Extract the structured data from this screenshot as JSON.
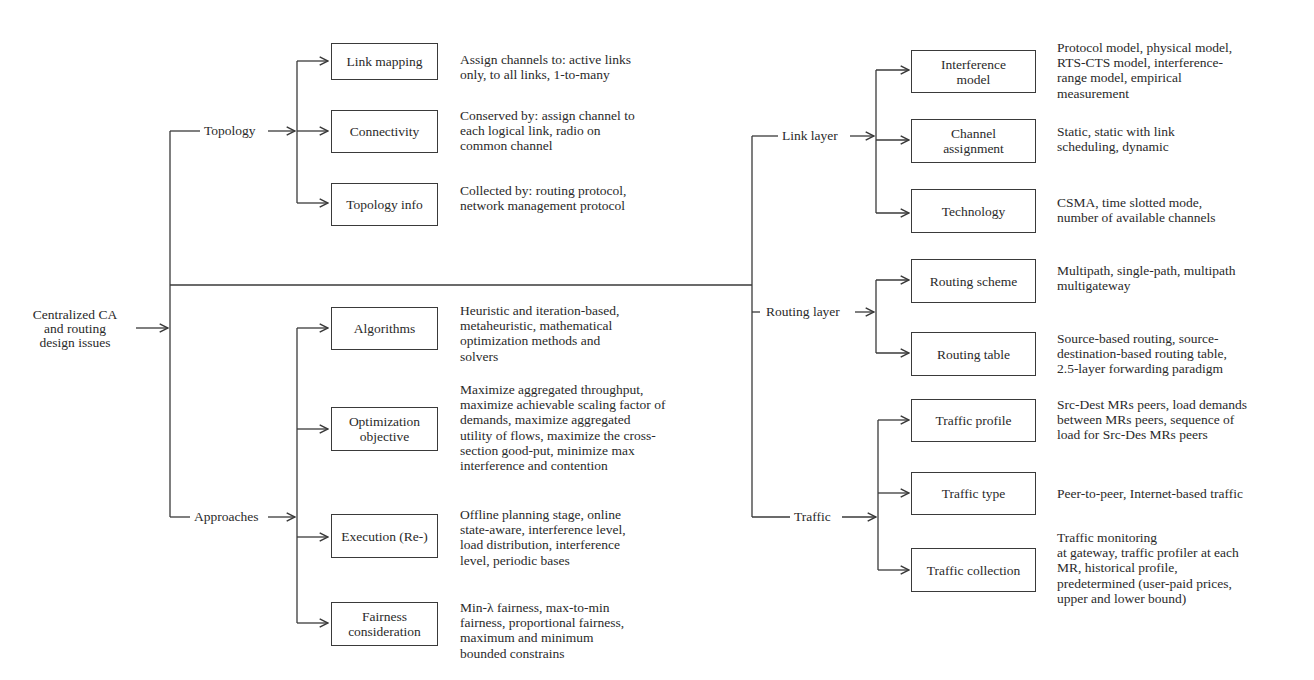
{
  "root": {
    "label": "Centralized CA\nand routing\ndesign issues"
  },
  "left": {
    "topology": {
      "label": "Topology",
      "items": [
        {
          "label": "Link mapping",
          "desc": "Assign channels to: active links\nonly, to all links, 1-to-many"
        },
        {
          "label": "Connectivity",
          "desc": "Conserved by: assign channel to\neach logical link, radio on\ncommon channel"
        },
        {
          "label": "Topology info",
          "desc": "Collected by: routing protocol,\nnetwork management protocol"
        }
      ]
    },
    "approaches": {
      "label": "Approaches",
      "items": [
        {
          "label": "Algorithms",
          "desc": "Heuristic and iteration-based,\nmetaheuristic, mathematical\noptimization methods and\nsolvers"
        },
        {
          "label": "Optimization\nobjective",
          "desc": "Maximize aggregated throughput,\nmaximize achievable scaling factor of\ndemands, maximize aggregated\nutility of flows, maximize the cross-\nsection good-put, minimize max\ninterference and contention"
        },
        {
          "label": "Execution (Re-)",
          "desc": "Offline planning stage, online\nstate-aware, interference level,\nload distribution, interference\nlevel, periodic bases"
        },
        {
          "label": "Fairness\nconsideration",
          "desc": "Min-λ fairness, max-to-min\nfairness, proportional fairness,\nmaximum and minimum\nbounded constrains"
        }
      ]
    }
  },
  "right": {
    "link_layer": {
      "label": "Link layer",
      "items": [
        {
          "label": "Interference\nmodel",
          "desc": "Protocol model, physical model,\nRTS-CTS model, interference-\nrange model, empirical\nmeasurement"
        },
        {
          "label": "Channel\nassignment",
          "desc": "Static, static with link\nscheduling, dynamic"
        },
        {
          "label": "Technology",
          "desc": "CSMA, time slotted mode,\nnumber of available channels"
        }
      ]
    },
    "routing_layer": {
      "label": "Routing layer",
      "items": [
        {
          "label": "Routing scheme",
          "desc": "Multipath, single-path, multipath\nmultigateway"
        },
        {
          "label": "Routing table",
          "desc": "Source-based routing, source-\ndestination-based routing table,\n2.5-layer forwarding paradigm"
        }
      ]
    },
    "traffic": {
      "label": "Traffic",
      "items": [
        {
          "label": "Traffic profile",
          "desc": "Src-Dest MRs peers, load demands\nbetween MRs peers, sequence of\nload for Src-Des MRs peers"
        },
        {
          "label": "Traffic type",
          "desc": "Peer-to-peer, Internet-based traffic"
        },
        {
          "label": "Traffic collection",
          "desc": "Traffic monitoring\nat gateway, traffic profiler at each\nMR, historical profile,\npredetermined (user-paid prices,\nupper and lower bound)"
        }
      ]
    }
  },
  "colors": {
    "line": "#3a3a3a",
    "text": "#2a2a2a",
    "background": "#ffffff"
  }
}
